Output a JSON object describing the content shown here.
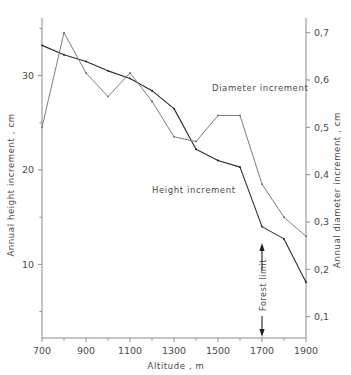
{
  "chart_data": {
    "type": "line",
    "title": "",
    "xlabel": "Altitude , m",
    "xlim": [
      700,
      1900
    ],
    "xticks": [
      700,
      900,
      1100,
      1300,
      1500,
      1700,
      1900
    ],
    "xticklabels": [
      "700",
      "900",
      "1100",
      "1300",
      "1500",
      "1700",
      "1900"
    ],
    "x_minor_ticks": [
      800,
      1000,
      1200,
      1400,
      1600,
      1800
    ],
    "left_axis": {
      "label": "Annual height increment , cm",
      "ylim": [
        2.2,
        36.1
      ],
      "ticks": [
        10,
        20,
        30
      ],
      "ticklabels": [
        "10",
        "20",
        "30"
      ],
      "minor_ticks": [
        5,
        15,
        25,
        35
      ],
      "units": "cm"
    },
    "right_axis": {
      "label": "Annual diameter increment , cm",
      "ylim": [
        0.055,
        0.731
      ],
      "ticks": [
        0.1,
        0.2,
        0.3,
        0.4,
        0.5,
        0.6,
        0.7
      ],
      "ticklabels": [
        "0,1",
        "0,2",
        "0,3",
        "0,4",
        "0,5",
        "0,6",
        "0,7"
      ],
      "units": "cm"
    },
    "grid": false,
    "legend_position": "inline-annotations",
    "series": [
      {
        "name": "Height increment",
        "axis": "left",
        "color": "#2b2b2b",
        "label_text": "Height  increment",
        "x": [
          700,
          800,
          900,
          1000,
          1100,
          1200,
          1300,
          1400,
          1500,
          1600,
          1700,
          1800,
          1900
        ],
        "values": [
          33.2,
          32.2,
          31.5,
          30.5,
          29.7,
          28.4,
          26.5,
          22.2,
          21.0,
          20.3,
          14.0,
          12.7,
          8.1
        ]
      },
      {
        "name": "Diameter increment",
        "axis": "right",
        "color": "#7d7d7d",
        "label_text": "Diameter  increment",
        "x": [
          700,
          800,
          900,
          1000,
          1100,
          1200,
          1300,
          1400,
          1500,
          1600,
          1700,
          1800,
          1900
        ],
        "values": [
          0.5,
          0.7,
          0.615,
          0.565,
          0.615,
          0.555,
          0.48,
          0.47,
          0.525,
          0.525,
          0.38,
          0.31,
          0.27
        ]
      }
    ],
    "annotations": [
      {
        "name": "forest-limit",
        "text": "Forest limit",
        "x": 1700,
        "orientation": "vertical",
        "arrow_up": true,
        "arrow_down": true
      }
    ]
  }
}
